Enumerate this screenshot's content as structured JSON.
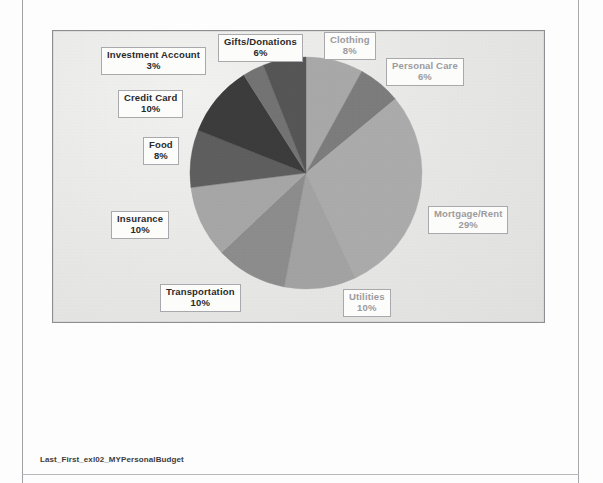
{
  "document": {
    "footer_filename": "Last_First_exl02_MYPersonalBudget"
  },
  "chart_data": {
    "type": "pie",
    "title": "",
    "subtitle": "",
    "xlabel": "",
    "ylabel": "",
    "legend_position": "none",
    "grid": false,
    "labels_outside": true,
    "label_format": "category name + percentage",
    "start_angle_deg": 0,
    "direction": "clockwise",
    "categories": [
      "Clothing",
      "Personal Care",
      "Mortgage/Rent",
      "Utilities",
      "Transportation",
      "Insurance",
      "Food",
      "Credit Card",
      "Investment Account",
      "Gifts/Donations"
    ],
    "values": [
      8,
      6,
      29,
      10,
      10,
      10,
      8,
      10,
      3,
      6
    ],
    "value_unit": "percent",
    "total": 100,
    "colors": [
      "#a9a9a9",
      "#7d7d7d",
      "#acacac",
      "#a3a3a3",
      "#8d8d8d",
      "#a7a7a7",
      "#5f5f5f",
      "#3c3c3c",
      "#747474",
      "#565656"
    ],
    "slices": [
      {
        "label": "Clothing",
        "percent": "8%",
        "value": 8,
        "color": "#a9a9a9",
        "label_style": "light"
      },
      {
        "label": "Personal Care",
        "percent": "6%",
        "value": 6,
        "color": "#7d7d7d",
        "label_style": "light"
      },
      {
        "label": "Mortgage/Rent",
        "percent": "29%",
        "value": 29,
        "color": "#acacac",
        "label_style": "light"
      },
      {
        "label": "Utilities",
        "percent": "10%",
        "value": 10,
        "color": "#a3a3a3",
        "label_style": "light"
      },
      {
        "label": "Transportation",
        "percent": "10%",
        "value": 10,
        "color": "#8d8d8d",
        "label_style": "dark"
      },
      {
        "label": "Insurance",
        "percent": "10%",
        "value": 10,
        "color": "#a7a7a7",
        "label_style": "dark"
      },
      {
        "label": "Food",
        "percent": "8%",
        "value": 8,
        "color": "#5f5f5f",
        "label_style": "dark"
      },
      {
        "label": "Credit Card",
        "percent": "10%",
        "value": 10,
        "color": "#3c3c3c",
        "label_style": "dark"
      },
      {
        "label": "Investment Account",
        "percent": "3%",
        "value": 3,
        "color": "#747474",
        "label_style": "dark"
      },
      {
        "label": "Gifts/Donations",
        "percent": "6%",
        "value": 6,
        "color": "#565656",
        "label_style": "dark"
      }
    ]
  },
  "chart_labels": {
    "clothing": {
      "name": "Clothing",
      "pct": "8%"
    },
    "personal_care": {
      "name": "Personal Care",
      "pct": "6%"
    },
    "mortgage_rent": {
      "name": "Mortgage/Rent",
      "pct": "29%"
    },
    "utilities": {
      "name": "Utilities",
      "pct": "10%"
    },
    "transportation": {
      "name": "Transportation",
      "pct": "10%"
    },
    "insurance": {
      "name": "Insurance",
      "pct": "10%"
    },
    "food": {
      "name": "Food",
      "pct": "8%"
    },
    "credit_card": {
      "name": "Credit Card",
      "pct": "10%"
    },
    "investment_account": {
      "name": "Investment Account",
      "pct": "3%"
    },
    "gifts_donations": {
      "name": "Gifts/Donations",
      "pct": "6%"
    }
  }
}
